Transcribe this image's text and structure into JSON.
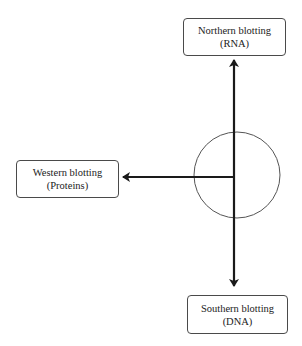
{
  "diagram": {
    "type": "blotting-techniques",
    "center": {
      "shape": "circle",
      "label": ""
    },
    "nodes": {
      "northern": {
        "title": "Northern blotting",
        "subtitle": "(RNA)",
        "direction": "up"
      },
      "western": {
        "title": "Western blotting",
        "subtitle": "(Proteins)",
        "direction": "left"
      },
      "southern": {
        "title": "Southern blotting",
        "subtitle": "(DNA)",
        "direction": "down"
      }
    },
    "colors": {
      "line": "#1a1a1a",
      "circle": "#555555",
      "box_border": "#4a4a4a",
      "background": "#ffffff"
    }
  }
}
